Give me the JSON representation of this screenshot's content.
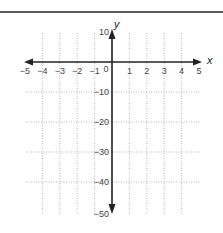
{
  "chart_data": {
    "type": "line",
    "title": "",
    "xlabel": "x",
    "ylabel": "y",
    "xlim": [
      -5,
      5
    ],
    "ylim": [
      -50,
      10
    ],
    "x_ticks": [
      "−5",
      "−4",
      "−3",
      "−2",
      "−1",
      "0",
      "1",
      "2",
      "3",
      "4",
      "5"
    ],
    "y_ticks": [
      "10",
      "−10",
      "−20",
      "−30",
      "−40",
      "−50"
    ],
    "grid": true,
    "grid_style": "dotted",
    "series": []
  },
  "colors": {
    "axis": "#222222",
    "grid": "#aaaaaa",
    "text": "#444444",
    "top_rule": "#5a5a5a"
  }
}
